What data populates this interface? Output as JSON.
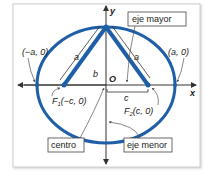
{
  "diagram": {
    "axes": {
      "x_label": "x",
      "y_label": "y",
      "origin_label": "O"
    },
    "points": {
      "left_vertex": "(−a, 0)",
      "right_vertex": "(a, 0)",
      "focus1_name": "F",
      "focus1_sub": "1",
      "focus1_coords": "(−c, 0)",
      "focus2_name": "F",
      "focus2_sub": "2",
      "focus2_coords": "(c, 0)"
    },
    "segments": {
      "a_left": "a",
      "a_right": "a",
      "b": "b",
      "c": "c"
    },
    "callouts": {
      "major_axis": "eje mayor",
      "minor_axis": "eje menor",
      "center": "centro"
    },
    "colors": {
      "ellipse": "#1f5fa8",
      "axis": "#333333",
      "frame": "#cfcfcf"
    }
  }
}
